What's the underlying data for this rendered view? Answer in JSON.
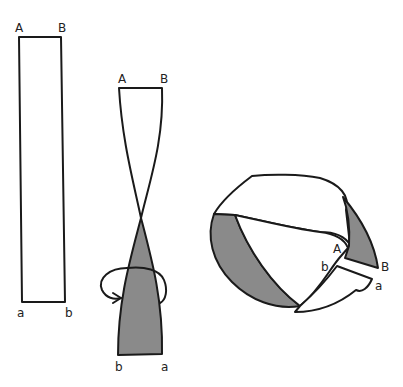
{
  "diagram": {
    "type": "mobius-strip-construction",
    "colors": {
      "outline": "#1a1a1a",
      "shade": "#8a8a8a",
      "background": "#ffffff"
    },
    "panels": [
      {
        "name": "flat-strip",
        "labels": {
          "top_left": "A",
          "top_right": "B",
          "bottom_left": "a",
          "bottom_right": "b"
        }
      },
      {
        "name": "twisted-strip",
        "labels": {
          "top_left": "A",
          "top_right": "B",
          "bottom_left": "b",
          "bottom_right": "a"
        },
        "annotation": "half-twist rotation arrow"
      },
      {
        "name": "mobius-loop",
        "labels": {
          "A": "A",
          "B": "B",
          "b": "b",
          "a": "a"
        }
      }
    ]
  }
}
